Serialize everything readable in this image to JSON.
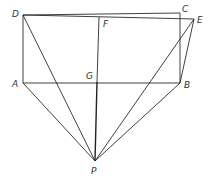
{
  "diagram": {
    "type": "geometry",
    "colors": {
      "stroke": "#2a2a2a",
      "label": "#333333",
      "background": "#ffffff"
    },
    "points": {
      "A": {
        "label": "A",
        "x": 23,
        "y": 83
      },
      "B": {
        "label": "B",
        "x": 180,
        "y": 83
      },
      "C": {
        "label": "C",
        "x": 180,
        "y": 13
      },
      "D": {
        "label": "D",
        "x": 23,
        "y": 15
      },
      "E": {
        "label": "E",
        "x": 194,
        "y": 19
      },
      "F": {
        "label": "F",
        "x": 99,
        "y": 17
      },
      "G": {
        "label": "G",
        "x": 97,
        "y": 82
      },
      "P": {
        "label": "P",
        "x": 95,
        "y": 161
      }
    },
    "segments": [
      [
        "D",
        "C"
      ],
      [
        "D",
        "E"
      ],
      [
        "D",
        "A"
      ],
      [
        "C",
        "B"
      ],
      [
        "A",
        "B"
      ],
      [
        "E",
        "B"
      ],
      [
        "F",
        "G"
      ],
      [
        "G",
        "P"
      ],
      [
        "D",
        "P"
      ],
      [
        "A",
        "P"
      ],
      [
        "E",
        "P"
      ],
      [
        "B",
        "P"
      ]
    ]
  }
}
